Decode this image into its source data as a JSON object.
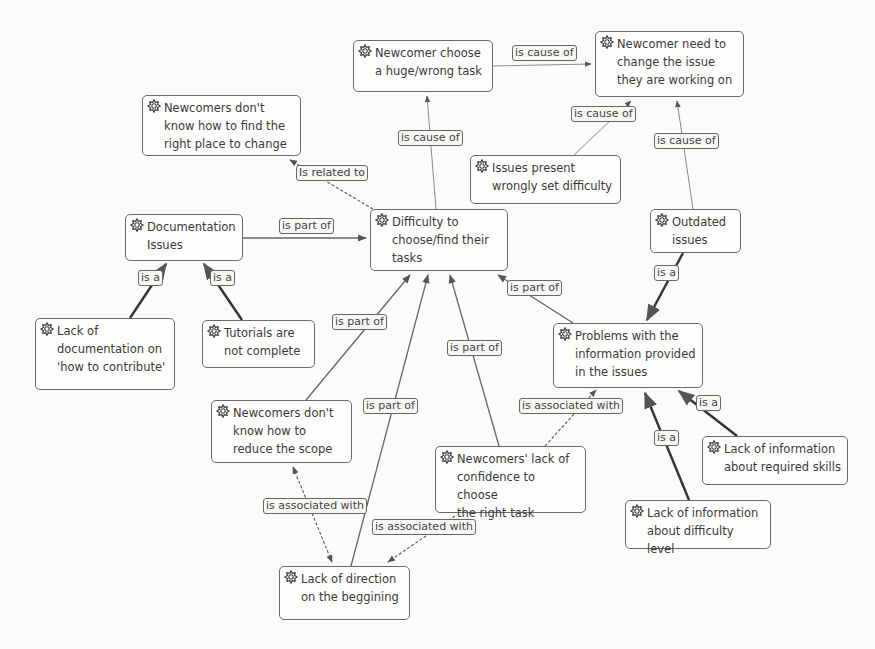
{
  "diagram": {
    "type": "concept-map",
    "node_icon": "gear-star-icon",
    "nodes": [
      {
        "id": "n1",
        "text": "Newcomer choose\na huge/wrong task",
        "x": 353,
        "y": 40,
        "w": 140,
        "h": 52
      },
      {
        "id": "n2",
        "text": "Newcomer need to\nchange the issue\nthey are working on",
        "x": 595,
        "y": 31,
        "w": 149,
        "h": 66
      },
      {
        "id": "n3",
        "text": "Newcomers don't\nknow how to find the\nright place to change",
        "x": 142,
        "y": 95,
        "w": 159,
        "h": 61
      },
      {
        "id": "n4",
        "text": "Issues present\nwrongly set difficulty",
        "x": 470,
        "y": 155,
        "w": 151,
        "h": 49
      },
      {
        "id": "n5",
        "text": "Documentation\nIssues",
        "x": 125,
        "y": 214,
        "w": 118,
        "h": 47
      },
      {
        "id": "n6",
        "text": "Difficulty to\nchoose/find their\ntasks",
        "x": 370,
        "y": 209,
        "w": 138,
        "h": 62
      },
      {
        "id": "n7",
        "text": "Outdated\nissues",
        "x": 650,
        "y": 209,
        "w": 91,
        "h": 44
      },
      {
        "id": "n8",
        "text": "Lack of\ndocumentation on\n'how to contribute'",
        "x": 35,
        "y": 318,
        "w": 140,
        "h": 72
      },
      {
        "id": "n9",
        "text": "Tutorials are\nnot complete",
        "x": 202,
        "y": 320,
        "w": 113,
        "h": 48
      },
      {
        "id": "n10",
        "text": "Problems with the\ninformation provided\nin the issues",
        "x": 553,
        "y": 323,
        "w": 150,
        "h": 65
      },
      {
        "id": "n11",
        "text": "Newcomers don't\nknow how to\nreduce the scope",
        "x": 211,
        "y": 400,
        "w": 141,
        "h": 63
      },
      {
        "id": "n12",
        "text": "Newcomers' lack of\nconfidence to choose\nthe right task",
        "x": 435,
        "y": 446,
        "w": 151,
        "h": 67
      },
      {
        "id": "n13",
        "text": "Lack of information\nabout required skills",
        "x": 702,
        "y": 436,
        "w": 146,
        "h": 49
      },
      {
        "id": "n14",
        "text": "Lack of information\nabout difficulty level",
        "x": 625,
        "y": 500,
        "w": 146,
        "h": 49
      },
      {
        "id": "n15",
        "text": "Lack of direction\non the beggining",
        "x": 279,
        "y": 566,
        "w": 131,
        "h": 54
      }
    ],
    "edges": [
      {
        "from": "n1",
        "to": "n2",
        "label": "is cause of",
        "style": "thin",
        "x1": 493,
        "y1": 66,
        "x2": 591,
        "y2": 64,
        "lx": 512,
        "ly": 45
      },
      {
        "from": "n6",
        "to": "n1",
        "label": "is cause of",
        "style": "thin",
        "x1": 436,
        "y1": 209,
        "x2": 427,
        "y2": 96,
        "lx": 398,
        "ly": 130
      },
      {
        "from": "n4",
        "to": "n2",
        "label": "is cause of",
        "style": "thin",
        "x1": 574,
        "y1": 155,
        "x2": 631,
        "y2": 101,
        "lx": 571,
        "ly": 106
      },
      {
        "from": "n7",
        "to": "n2",
        "label": "is cause of",
        "style": "thin",
        "x1": 693,
        "y1": 209,
        "x2": 677,
        "y2": 101,
        "lx": 654,
        "ly": 133
      },
      {
        "from": "n6",
        "to": "n3",
        "label": "Is related to",
        "style": "dashed",
        "x1": 373,
        "y1": 209,
        "x2": 290,
        "y2": 160,
        "lx": 296,
        "ly": 165
      },
      {
        "from": "n5",
        "to": "n6",
        "label": "is part of",
        "style": "medium",
        "x1": 243,
        "y1": 238,
        "x2": 366,
        "y2": 238,
        "lx": 279,
        "ly": 218
      },
      {
        "from": "n8",
        "to": "n5",
        "label": "is a",
        "style": "thick",
        "x1": 130,
        "y1": 318,
        "x2": 166,
        "y2": 264,
        "lx": 138,
        "ly": 270
      },
      {
        "from": "n9",
        "to": "n5",
        "label": "is a",
        "style": "thick",
        "x1": 242,
        "y1": 320,
        "x2": 204,
        "y2": 264,
        "lx": 210,
        "ly": 270
      },
      {
        "from": "n10",
        "to": "n6",
        "label": "is part of",
        "style": "medium",
        "x1": 573,
        "y1": 323,
        "x2": 498,
        "y2": 275,
        "lx": 507,
        "ly": 280
      },
      {
        "from": "n7",
        "to": "n10",
        "label": "is a",
        "style": "thick",
        "x1": 683,
        "y1": 253,
        "x2": 647,
        "y2": 320,
        "lx": 654,
        "ly": 265
      },
      {
        "from": "n11",
        "to": "n6",
        "label": "is part of",
        "style": "medium",
        "x1": 306,
        "y1": 400,
        "x2": 410,
        "y2": 275,
        "lx": 332,
        "ly": 314
      },
      {
        "from": "n15",
        "to": "n6",
        "label": "is part of",
        "style": "medium",
        "x1": 351,
        "y1": 566,
        "x2": 428,
        "y2": 275,
        "lx": 363,
        "ly": 398
      },
      {
        "from": "n12",
        "to": "n6",
        "label": "is part of",
        "style": "medium",
        "x1": 499,
        "y1": 446,
        "x2": 450,
        "y2": 275,
        "lx": 447,
        "ly": 340
      },
      {
        "from": "n12",
        "to": "n10",
        "label": "is associated with",
        "style": "dashed",
        "x1": 545,
        "y1": 446,
        "x2": 596,
        "y2": 390,
        "lx": 519,
        "ly": 398
      },
      {
        "from": "n11",
        "to": "n15",
        "label": "is associated with",
        "style": "dashed-bidir",
        "x1": 293,
        "y1": 467,
        "x2": 332,
        "y2": 562,
        "lx": 263,
        "ly": 498
      },
      {
        "from": "n12",
        "to": "n15",
        "label": "is associated with",
        "style": "dashed",
        "x1": 455,
        "y1": 516,
        "x2": 388,
        "y2": 562,
        "lx": 372,
        "ly": 519
      },
      {
        "from": "n13",
        "to": "n10",
        "label": "is a",
        "style": "thick",
        "x1": 737,
        "y1": 436,
        "x2": 679,
        "y2": 391,
        "lx": 696,
        "ly": 395
      },
      {
        "from": "n14",
        "to": "n10",
        "label": "is a",
        "style": "thick",
        "x1": 689,
        "y1": 500,
        "x2": 645,
        "y2": 393,
        "lx": 654,
        "ly": 430
      }
    ]
  }
}
